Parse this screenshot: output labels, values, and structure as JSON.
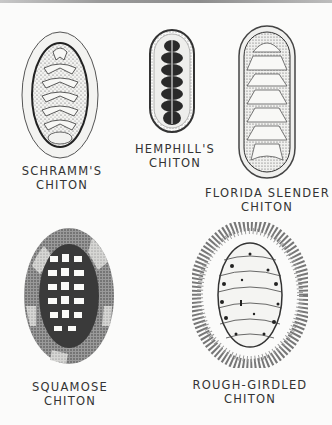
{
  "plate": {
    "specimens": [
      {
        "name_line1": "SCHRAMM'S",
        "name_line2": "CHITON"
      },
      {
        "name_line1": "HEMPHILL'S",
        "name_line2": "CHITON"
      },
      {
        "name_line1": "FLORIDA SLENDER",
        "name_line2": "CHITON"
      },
      {
        "name_line1": "SQUAMOSE",
        "name_line2": "CHITON"
      },
      {
        "name_line1": "ROUGH-GIRDLED",
        "name_line2": "CHITON"
      }
    ]
  }
}
